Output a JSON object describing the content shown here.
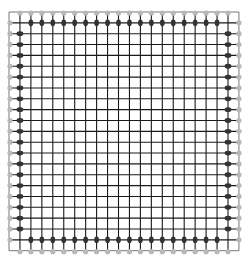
{
  "diagram": {
    "type": "square-lattice-with-boundary-dots",
    "width": 249,
    "height": 263,
    "grid": {
      "x0": 9,
      "y0": 12,
      "spacing_x": 10.95,
      "spacing_y": 10.85,
      "cols": 21,
      "rows": 22,
      "line_color": "#1a1a1a",
      "line_width": 1.1
    },
    "outer_border": {
      "color": "#555555",
      "width": 0.8
    },
    "inner_dots": {
      "description": "dark elongated dots along the inner boundary ring",
      "color": "#333333",
      "rx": 2.4,
      "ry": 3.4
    },
    "outer_dots": {
      "description": "light dots along the outermost boundary ring",
      "color": "#b8b8b8",
      "r": 2.6
    }
  }
}
